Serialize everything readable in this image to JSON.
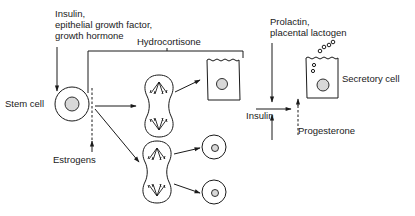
{
  "labels": {
    "top_hormones": [
      "Insulin,",
      "epithelial growth factor,",
      "growth hormone"
    ],
    "hydrocortisone": "Hydrocortisone",
    "stem_cell": "Stem cell",
    "estrogens": "Estrogens",
    "prolactin": [
      "Prolactin,",
      "placental lactogen"
    ],
    "insulin": "Insulin",
    "progesterone": "Progesterone",
    "secretory_cell": "Secretory cell"
  },
  "colors": {
    "ink": "#1a1a1a",
    "background": "#ffffff",
    "nucleus": "#d8d8d8"
  }
}
